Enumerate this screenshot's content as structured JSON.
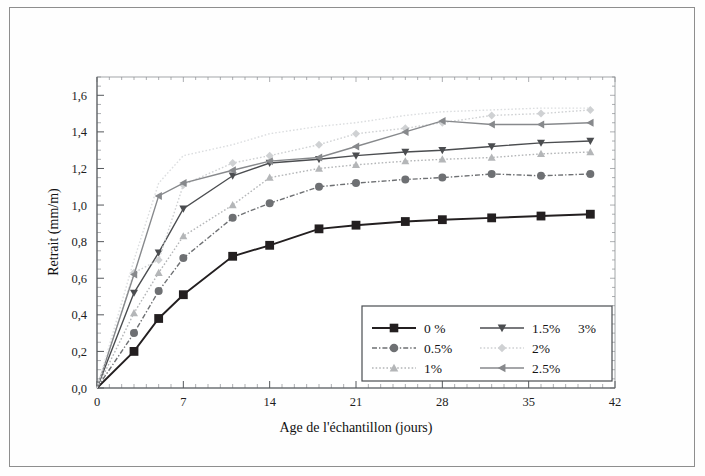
{
  "figure": {
    "background_color": "#fefefe",
    "frame_color": "#8e8e8e"
  },
  "chart_data": {
    "type": "line",
    "title": "",
    "xlabel": "Age de l'échantillon (jours)",
    "ylabel": "Retrait (mm/m)",
    "xlim": [
      0,
      42
    ],
    "ylim": [
      0.0,
      1.7
    ],
    "xticks": [
      0,
      7,
      14,
      21,
      28,
      35,
      42
    ],
    "xtick_labels": [
      "0",
      "7",
      "14",
      "21",
      "28",
      "35",
      "42"
    ],
    "yticks": [
      0.0,
      0.2,
      0.4,
      0.6,
      0.8,
      1.0,
      1.2,
      1.4,
      1.6
    ],
    "ytick_labels": [
      "0,0",
      "0,2",
      "0,4",
      "0,6",
      "0,8",
      "1,0",
      "1,2",
      "1,4",
      "1,6"
    ],
    "minor_ticks": true,
    "grid": false,
    "legend_position": "inside lower right",
    "x": [
      0,
      3,
      5,
      7,
      11,
      14,
      18,
      21,
      25,
      28,
      32,
      36,
      40
    ],
    "series": [
      {
        "name": "0 %",
        "marker": "square",
        "color": "#231f20",
        "line_style": "solid",
        "values": [
          0.0,
          0.2,
          0.38,
          0.51,
          0.72,
          0.78,
          0.87,
          0.89,
          0.91,
          0.92,
          0.93,
          0.94,
          0.95
        ]
      },
      {
        "name": "0.5%",
        "marker": "circle",
        "color": "#6e7073",
        "line_style": "dashdot",
        "values": [
          0.0,
          0.3,
          0.53,
          0.71,
          0.93,
          1.01,
          1.1,
          1.12,
          1.14,
          1.15,
          1.17,
          1.16,
          1.17
        ]
      },
      {
        "name": "1%",
        "marker": "triangle-up",
        "color": "#b4b6b8",
        "line_style": "dotted",
        "values": [
          0.0,
          0.41,
          0.63,
          0.83,
          1.0,
          1.15,
          1.2,
          1.22,
          1.24,
          1.25,
          1.26,
          1.28,
          1.29
        ]
      },
      {
        "name": "1.5%",
        "marker": "triangle-down",
        "color": "#4b4d50",
        "line_style": "solid",
        "values": [
          0.0,
          0.52,
          0.74,
          0.98,
          1.16,
          1.23,
          1.25,
          1.27,
          1.29,
          1.3,
          1.32,
          1.34,
          1.35
        ]
      },
      {
        "name": "2%",
        "marker": "diamond",
        "color": "#cfd1d3",
        "line_style": "dotted",
        "values": [
          0.0,
          0.63,
          0.7,
          1.11,
          1.23,
          1.27,
          1.33,
          1.39,
          1.42,
          1.45,
          1.49,
          1.5,
          1.52
        ]
      },
      {
        "name": "2.5%",
        "marker": "triangle-left",
        "color": "#87898c",
        "line_style": "solid",
        "values": [
          0.0,
          0.62,
          1.05,
          1.12,
          1.19,
          1.24,
          1.26,
          1.32,
          1.4,
          1.46,
          1.44,
          1.44,
          1.45
        ]
      },
      {
        "name": "3%",
        "marker": "none",
        "color": "#dcdee0",
        "line_style": "dotted",
        "values": [
          0.0,
          0.7,
          1.12,
          1.27,
          1.33,
          1.39,
          1.43,
          1.45,
          1.49,
          1.51,
          1.52,
          1.53,
          1.53
        ]
      }
    ]
  },
  "legend": {
    "columns": [
      [
        "0 %",
        "0.5%",
        "1%"
      ],
      [
        "1.5%",
        "2%",
        "2.5%"
      ],
      [
        "3%"
      ]
    ],
    "entries": [
      {
        "label": "0 %",
        "marker": "square",
        "color": "#231f20",
        "line_style": "solid",
        "show_line": true
      },
      {
        "label": "0.5%",
        "marker": "circle",
        "color": "#6e7073",
        "line_style": "dashdot",
        "show_line": true
      },
      {
        "label": "1%",
        "marker": "triangle-up",
        "color": "#b4b6b8",
        "line_style": "dotted",
        "show_line": true
      },
      {
        "label": "1.5%",
        "marker": "triangle-down",
        "color": "#4b4d50",
        "line_style": "solid",
        "show_line": true
      },
      {
        "label": "2%",
        "marker": "diamond",
        "color": "#cfd1d3",
        "line_style": "dotted",
        "show_line": true
      },
      {
        "label": "2.5%",
        "marker": "triangle-left",
        "color": "#87898c",
        "line_style": "solid",
        "show_line": true
      },
      {
        "label": "3%",
        "marker": "none",
        "color": "#e8eaec",
        "line_style": "none",
        "show_line": false
      }
    ]
  }
}
